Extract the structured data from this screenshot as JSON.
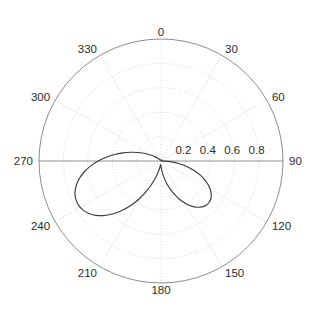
{
  "chart_data": {
    "type": "line",
    "subtype": "polar",
    "title": "",
    "subtitle": "",
    "xlabel": "",
    "ylabel": "",
    "angle_unit": "degrees",
    "angle_zero_at": "top",
    "angle_direction": "clockwise",
    "theta_tick_labels": [
      "0",
      "30",
      "60",
      "90",
      "120",
      "150",
      "180",
      "210",
      "240",
      "270",
      "300",
      "330"
    ],
    "theta_ticks": [
      0,
      30,
      60,
      90,
      120,
      150,
      180,
      210,
      240,
      270,
      300,
      330
    ],
    "r_tick_labels": [
      "0.2",
      "0.4",
      "0.6",
      "0.8"
    ],
    "r_ticks": [
      0.2,
      0.4,
      0.6,
      0.8
    ],
    "rlim": [
      0,
      1.0
    ],
    "grid": true,
    "legend": null,
    "legend_position": "none",
    "grid_color": "#bfbfbf",
    "axis_color": "#808080",
    "series": [
      {
        "name": "radiation-pattern",
        "color": "#3c3c3c",
        "closed": true,
        "theta": [
          90,
          94,
          98,
          102,
          106,
          110,
          114,
          118,
          122,
          126,
          130,
          134,
          138,
          142,
          146,
          150,
          154,
          158,
          162,
          166,
          170,
          174,
          178,
          182,
          186,
          190,
          194,
          198,
          202,
          206,
          210,
          214,
          218,
          222,
          226,
          230,
          234,
          238,
          242,
          246,
          250,
          254,
          258,
          262,
          266,
          270,
          274,
          278,
          282,
          286,
          290,
          294,
          298,
          302,
          306,
          310,
          314,
          318,
          322,
          326,
          330,
          334,
          338,
          342,
          346,
          350,
          354,
          358,
          2,
          6,
          10,
          14,
          18,
          22,
          26,
          30,
          34,
          38,
          42,
          46,
          50,
          54,
          58,
          62,
          66,
          70,
          74,
          78,
          82,
          86
        ],
        "r": [
          0.012,
          0.075,
          0.145,
          0.215,
          0.283,
          0.345,
          0.4,
          0.447,
          0.483,
          0.508,
          0.52,
          0.519,
          0.506,
          0.481,
          0.446,
          0.402,
          0.351,
          0.296,
          0.24,
          0.185,
          0.134,
          0.09,
          0.055,
          0.034,
          0.032,
          0.05,
          0.088,
          0.142,
          0.208,
          0.282,
          0.36,
          0.438,
          0.513,
          0.582,
          0.643,
          0.693,
          0.731,
          0.756,
          0.767,
          0.765,
          0.75,
          0.722,
          0.683,
          0.634,
          0.577,
          0.515,
          0.45,
          0.384,
          0.32,
          0.26,
          0.205,
          0.156,
          0.114,
          0.08,
          0.054,
          0.035,
          0.023,
          0.016,
          0.012,
          0.01,
          0.009,
          0.008,
          0.008,
          0.007,
          0.007,
          0.007,
          0.006,
          0.006,
          0.006,
          0.006,
          0.007,
          0.007,
          0.007,
          0.008,
          0.008,
          0.009,
          0.01,
          0.01,
          0.011,
          0.011,
          0.011,
          0.011,
          0.011,
          0.011,
          0.011,
          0.011,
          0.011,
          0.011,
          0.011,
          0.011
        ]
      }
    ],
    "annotations": []
  },
  "axes": {
    "center_x": 161,
    "center_y": 161,
    "radius": 122
  }
}
